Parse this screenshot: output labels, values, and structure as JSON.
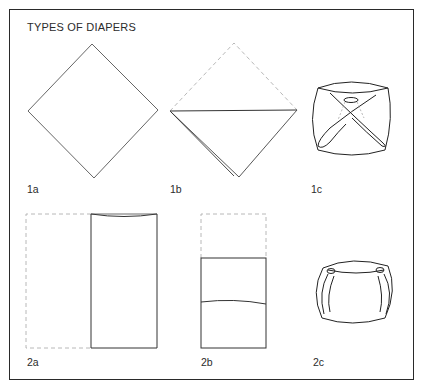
{
  "title": "TYPES OF DIAPERS",
  "figures": [
    {
      "id": "1a",
      "label": "1a",
      "description": "square cloth laid as diamond"
    },
    {
      "id": "1b",
      "label": "1b",
      "description": "diamond folded into triangle, top corner dashed"
    },
    {
      "id": "1c",
      "label": "1c",
      "description": "triangle diaper fastened with single pin"
    },
    {
      "id": "2a",
      "label": "2a",
      "description": "rectangle folded in half lengthwise, left half dashed"
    },
    {
      "id": "2b",
      "label": "2b",
      "description": "strip folded up, top part dashed"
    },
    {
      "id": "2c",
      "label": "2c",
      "description": "rectangular diaper fastened with two pins"
    }
  ],
  "colors": {
    "line": "#2a2a2a",
    "dashed": "#b0b0b0",
    "background": "#ffffff"
  }
}
